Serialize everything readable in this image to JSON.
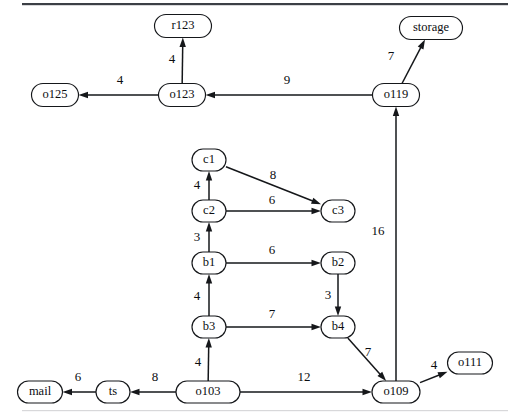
{
  "chart_data": {
    "type": "diagram",
    "title": "",
    "subtitle": "",
    "layout": "directed-graph",
    "grid": false,
    "legend": "none",
    "nodes": [
      {
        "id": "r123",
        "label": "r123",
        "x": 183,
        "y": 26,
        "w": 57,
        "h": 23
      },
      {
        "id": "storage",
        "label": "storage",
        "x": 431,
        "y": 28,
        "w": 63,
        "h": 23
      },
      {
        "id": "o125",
        "label": "o125",
        "x": 55,
        "y": 95,
        "w": 47,
        "h": 23
      },
      {
        "id": "o123",
        "label": "o123",
        "x": 182,
        "y": 95,
        "w": 47,
        "h": 23
      },
      {
        "id": "o119",
        "label": "o119",
        "x": 396,
        "y": 95,
        "w": 47,
        "h": 23
      },
      {
        "id": "c1",
        "label": "c1",
        "x": 209,
        "y": 160,
        "w": 34,
        "h": 22
      },
      {
        "id": "c2",
        "label": "c2",
        "x": 209,
        "y": 211,
        "w": 34,
        "h": 22
      },
      {
        "id": "c3",
        "label": "c3",
        "x": 338,
        "y": 211,
        "w": 34,
        "h": 22
      },
      {
        "id": "b1",
        "label": "b1",
        "x": 209,
        "y": 263,
        "w": 34,
        "h": 22
      },
      {
        "id": "b2",
        "label": "b2",
        "x": 338,
        "y": 263,
        "w": 34,
        "h": 22
      },
      {
        "id": "b3",
        "label": "b3",
        "x": 209,
        "y": 327,
        "w": 34,
        "h": 22
      },
      {
        "id": "b4",
        "label": "b4",
        "x": 338,
        "y": 327,
        "w": 34,
        "h": 22
      },
      {
        "id": "o111",
        "label": "o111",
        "x": 470,
        "y": 363,
        "w": 45,
        "h": 22
      },
      {
        "id": "mail",
        "label": "mail",
        "x": 40,
        "y": 392,
        "w": 45,
        "h": 22
      },
      {
        "id": "ts",
        "label": "ts",
        "x": 113,
        "y": 392,
        "w": 34,
        "h": 22
      },
      {
        "id": "o103",
        "label": "o103",
        "x": 208,
        "y": 392,
        "w": 64,
        "h": 22
      },
      {
        "id": "o109",
        "label": "o109",
        "x": 396,
        "y": 392,
        "w": 48,
        "h": 22
      }
    ],
    "edges": [
      {
        "from": "o123",
        "to": "r123",
        "weight": "4",
        "lx": 172,
        "ly": 60
      },
      {
        "from": "o123",
        "to": "o125",
        "weight": "4",
        "lx": 120,
        "ly": 81
      },
      {
        "from": "o119",
        "to": "o123",
        "weight": "9",
        "lx": 287,
        "ly": 81
      },
      {
        "from": "o119",
        "to": "storage",
        "weight": "7",
        "lx": 391,
        "ly": 57
      },
      {
        "from": "c2",
        "to": "c1",
        "weight": "4",
        "lx": 197,
        "ly": 186
      },
      {
        "from": "c1",
        "to": "c3",
        "weight": "8",
        "lx": 273,
        "ly": 176
      },
      {
        "from": "c2",
        "to": "c3",
        "weight": "6",
        "lx": 272,
        "ly": 201
      },
      {
        "from": "b1",
        "to": "c2",
        "weight": "3",
        "lx": 197,
        "ly": 238
      },
      {
        "from": "b1",
        "to": "b2",
        "weight": "6",
        "lx": 272,
        "ly": 251
      },
      {
        "from": "b3",
        "to": "b1",
        "weight": "4",
        "lx": 197,
        "ly": 297
      },
      {
        "from": "b2",
        "to": "b4",
        "weight": "3",
        "lx": 328,
        "ly": 296
      },
      {
        "from": "b3",
        "to": "b4",
        "weight": "7",
        "lx": 272,
        "ly": 315
      },
      {
        "from": "o103",
        "to": "b3",
        "weight": "4",
        "lx": 198,
        "ly": 363
      },
      {
        "from": "o103",
        "to": "ts",
        "weight": "8",
        "lx": 155,
        "ly": 378
      },
      {
        "from": "ts",
        "to": "mail",
        "weight": "6",
        "lx": 78,
        "ly": 378
      },
      {
        "from": "o103",
        "to": "o109",
        "weight": "12",
        "lx": 304,
        "ly": 378
      },
      {
        "from": "b4",
        "to": "o109",
        "weight": "7",
        "lx": 368,
        "ly": 353
      },
      {
        "from": "o109",
        "to": "o119",
        "weight": "16",
        "lx": 378,
        "ly": 232
      },
      {
        "from": "o109",
        "to": "o111",
        "weight": "4",
        "lx": 434,
        "ly": 366
      }
    ],
    "node_labels": [
      "r123",
      "storage",
      "o125",
      "o123",
      "o119",
      "c1",
      "c2",
      "c3",
      "b1",
      "b2",
      "b3",
      "b4",
      "o111",
      "mail",
      "ts",
      "o103",
      "o109"
    ],
    "edge_weights": [
      "4",
      "4",
      "9",
      "7",
      "4",
      "8",
      "6",
      "3",
      "6",
      "4",
      "3",
      "7",
      "4",
      "8",
      "6",
      "12",
      "7",
      "16",
      "4"
    ]
  },
  "colors": {
    "node_stroke": "#15171a",
    "node_fill": "#ffffff",
    "edge_stroke": "#15171a",
    "text": "#0b0d10",
    "rule_top": "#3c3f45",
    "rule_bottom": "#d8d8da",
    "background": "#ffffff"
  }
}
